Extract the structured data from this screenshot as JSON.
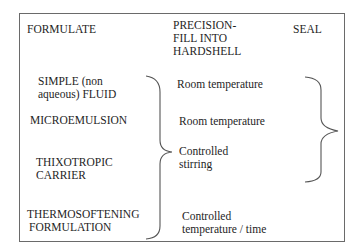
{
  "headers": {
    "formulate": "FORMULATE",
    "fill_line1": "PRECISION-",
    "fill_line2": "FILL INTO",
    "fill_line3": "HARDSHELL",
    "seal": "SEAL"
  },
  "formulations": [
    {
      "line1": "SIMPLE (non",
      "line2": "aqueous) FLUID"
    },
    {
      "line1": "MICROEMULSION"
    },
    {
      "line1": "THIXOTROPIC",
      "line2": "CARRIER"
    },
    {
      "line1": "THERMOSOFTENING",
      "line2": "FORMULATION"
    }
  ],
  "fill_conditions": [
    {
      "line1": "Room temperature"
    },
    {
      "line1": "Room temperature"
    },
    {
      "line1": "Controlled",
      "line2": "stirring"
    },
    {
      "line1": "Controlled",
      "line2": "temperature / time"
    }
  ],
  "colors": {
    "text": "#1e1e1e",
    "border": "#6a6a6a",
    "brace": "#555555"
  }
}
